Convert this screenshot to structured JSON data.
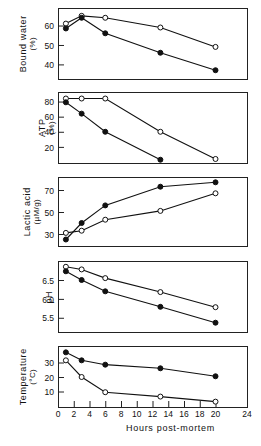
{
  "figure": {
    "xlabel": "Hours post-mortem",
    "x_ticks": [
      0,
      2,
      4,
      6,
      8,
      10,
      12,
      14,
      16,
      18,
      20,
      24
    ],
    "x_tick_labels": [
      "0",
      "2",
      "4",
      "6",
      "8",
      "10",
      "12",
      "14",
      "16",
      "18",
      "20",
      "24"
    ],
    "xlim": [
      0,
      24
    ],
    "series_names": [
      "open-circle series",
      "filled-circle series"
    ]
  },
  "chart_data": [
    {
      "type": "line",
      "title": "",
      "xlabel": "",
      "ylabel": "Bound water",
      "yunit": "(%)",
      "ylim": [
        33,
        68
      ],
      "y_ticks": [
        40,
        50,
        60
      ],
      "y_tick_labels": [
        "40",
        "50",
        "60"
      ],
      "xlim": [
        0,
        24
      ],
      "grid": false,
      "legend": "none",
      "x": [
        1,
        3,
        6,
        13,
        20
      ],
      "series": [
        {
          "name": "open",
          "marker": "open-circle",
          "values": [
            61,
            65,
            64,
            59,
            49
          ]
        },
        {
          "name": "filled",
          "marker": "filled-circle",
          "values": [
            58.5,
            64,
            56,
            46,
            37
          ]
        }
      ]
    },
    {
      "type": "line",
      "title": "",
      "xlabel": "",
      "ylabel": "ATP",
      "yunit": "(%)",
      "ylim": [
        0,
        90
      ],
      "y_ticks": [
        20,
        40,
        60,
        80
      ],
      "y_tick_labels": [
        "20",
        "40",
        "60",
        "80"
      ],
      "xlim": [
        0,
        24
      ],
      "grid": false,
      "legend": "none",
      "x": [
        1,
        3,
        6,
        13,
        20
      ],
      "series": [
        {
          "name": "open",
          "marker": "open-circle",
          "values": [
            84,
            84,
            84,
            40,
            4
          ]
        },
        {
          "name": "filled",
          "marker": "filled-circle",
          "values": [
            79,
            64,
            40,
            3,
            null
          ]
        }
      ]
    },
    {
      "type": "line",
      "title": "",
      "xlabel": "",
      "ylabel": "Lactic acid",
      "yunit": "(µM/g)",
      "ylim": [
        20,
        80
      ],
      "y_ticks": [
        30,
        50,
        70
      ],
      "y_tick_labels": [
        "30",
        "50",
        "70"
      ],
      "xlim": [
        0,
        24
      ],
      "grid": false,
      "legend": "none",
      "x": [
        1,
        3,
        6,
        13,
        20
      ],
      "series": [
        {
          "name": "open",
          "marker": "open-circle",
          "values": [
            31,
            33,
            43,
            51,
            67
          ]
        },
        {
          "name": "filled",
          "marker": "filled-circle",
          "values": [
            25,
            40,
            56,
            73,
            77
          ]
        }
      ]
    },
    {
      "type": "line",
      "title": "",
      "xlabel": "",
      "ylabel": "pH",
      "yunit": "",
      "ylim": [
        5.15,
        6.95
      ],
      "y_ticks": [
        5.5,
        6.0,
        6.5
      ],
      "y_tick_labels": [
        "5.5",
        "6.0",
        "6.5"
      ],
      "xlim": [
        0,
        24
      ],
      "grid": false,
      "legend": "none",
      "x": [
        1,
        3,
        6,
        13,
        20
      ],
      "series": [
        {
          "name": "open",
          "marker": "open-circle",
          "values": [
            6.85,
            6.78,
            6.55,
            6.18,
            5.78
          ]
        },
        {
          "name": "filled",
          "marker": "filled-circle",
          "values": [
            6.73,
            6.5,
            6.2,
            5.79,
            5.37
          ]
        }
      ]
    },
    {
      "type": "line",
      "title": "",
      "xlabel": "Hours post-mortem",
      "ylabel": "Temperature",
      "yunit": "(°C)",
      "ylim": [
        0,
        40
      ],
      "y_ticks": [
        10,
        20,
        30
      ],
      "y_tick_labels": [
        "10",
        "20",
        "30"
      ],
      "xlim": [
        0,
        24
      ],
      "grid": false,
      "legend": "none",
      "x": [
        1,
        3,
        6,
        13,
        20
      ],
      "series": [
        {
          "name": "open",
          "marker": "open-circle",
          "values": [
            31.5,
            20,
            9.5,
            6.5,
            3
          ]
        },
        {
          "name": "filled",
          "marker": "filled-circle",
          "values": [
            37,
            31.5,
            28.5,
            26,
            20.5
          ]
        }
      ]
    }
  ]
}
